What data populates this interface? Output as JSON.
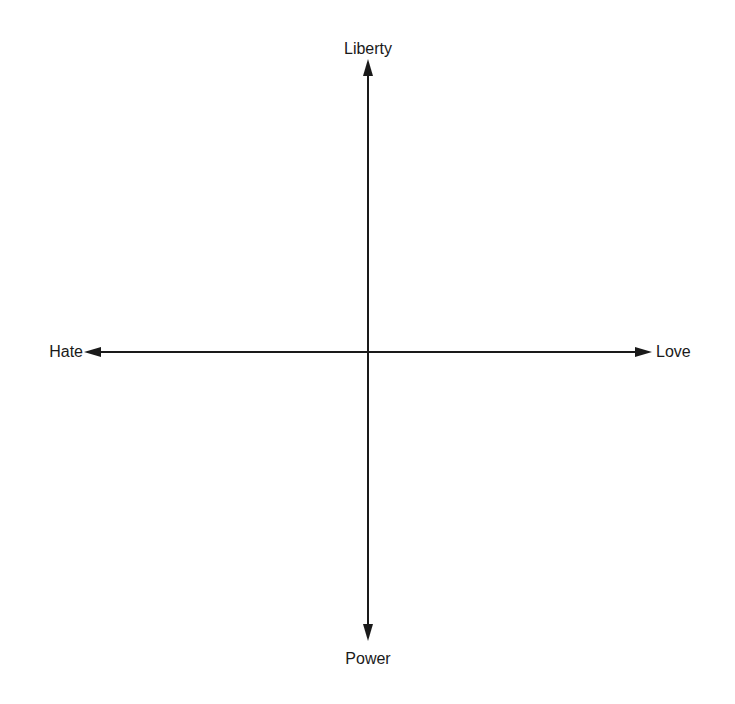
{
  "diagram": {
    "type": "two-axis quadrant diagram",
    "axes": {
      "vertical": {
        "top_label": "Liberty",
        "bottom_label": "Power"
      },
      "horizontal": {
        "left_label": "Hate",
        "right_label": "Love"
      }
    },
    "colors": {
      "line": "#1a1a1a",
      "background": "#ffffff"
    }
  }
}
